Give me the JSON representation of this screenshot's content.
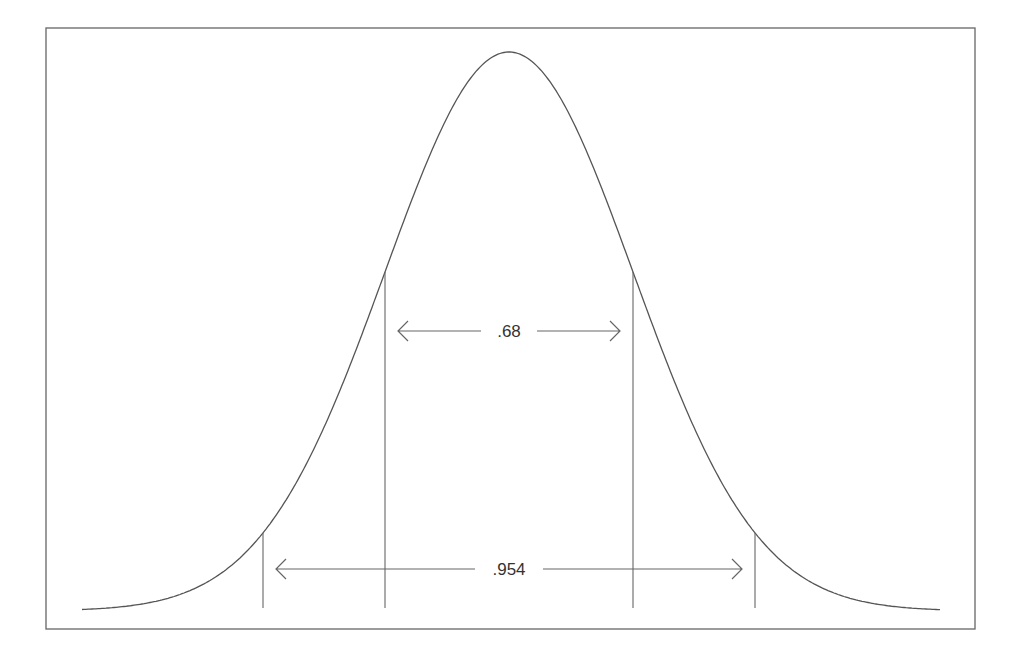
{
  "figure": {
    "type": "normal-distribution-diagram",
    "frame": {
      "x": 46,
      "y": 28,
      "width": 929,
      "height": 601,
      "stroke": "#555555"
    },
    "curve": {
      "mean_x": 509,
      "sigma_px": 124,
      "peak_y": 52,
      "baseline_y": 611,
      "x_start": 82,
      "x_end": 941,
      "stroke": "#555555"
    },
    "markers": [
      {
        "name": "minus-2-sigma",
        "x": 263
      },
      {
        "name": "minus-1-sigma",
        "x": 385
      },
      {
        "name": "plus-1-sigma",
        "x": 633
      },
      {
        "name": "plus-2-sigma",
        "x": 755
      }
    ],
    "marker_bottom_y": 608,
    "arrows": [
      {
        "name": "one-sigma-range",
        "label": ".68",
        "x1": 398,
        "x2": 620,
        "y": 331
      },
      {
        "name": "two-sigma-range",
        "label": ".954",
        "x1": 276,
        "x2": 742,
        "y": 569
      }
    ]
  },
  "labels": {
    "one_sigma": ".68",
    "two_sigma": ".954"
  }
}
